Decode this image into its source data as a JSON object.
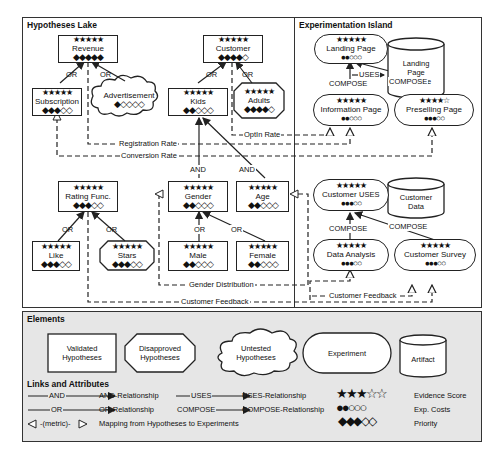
{
  "hypotheses_lake": {
    "title": "Hypotheses Lake",
    "nodes": {
      "revenue": {
        "label": "Revenue",
        "stars": "★★★★★",
        "priority": "◆◆◆◆◆",
        "type": "validated"
      },
      "subscription": {
        "label": "Subscription",
        "stars": "★★★★★",
        "priority": "◆◆◆◇◇",
        "type": "validated"
      },
      "advertisement": {
        "label": "Advertisement",
        "stars": "",
        "priority": "◆◇◇◇◇",
        "type": "untested"
      },
      "customer": {
        "label": "Customer",
        "stars": "★★★★★",
        "priority": "◆◆◆◆◇",
        "type": "validated"
      },
      "kids": {
        "label": "Kids",
        "stars": "★★★★★",
        "priority": "◆◆◇◇◇",
        "type": "validated"
      },
      "adults": {
        "label": "Adults",
        "stars": "★★★★★",
        "priority": "◆◆◆◆◇",
        "type": "disapproved"
      },
      "rating_func": {
        "label": "Rating Func.",
        "stars": "★★★★★",
        "priority": "◆◆◆◇◇",
        "type": "validated"
      },
      "like": {
        "label": "Like",
        "stars": "★★★★★",
        "priority": "◆◆◆◇◇",
        "type": "validated"
      },
      "stars_node": {
        "label": "Stars",
        "stars": "★★★★★",
        "priority": "◆◆◆◇◇",
        "type": "disapproved"
      },
      "gender": {
        "label": "Gender",
        "stars": "★★★★★",
        "priority": "◆◆◇◇◇",
        "type": "validated"
      },
      "age": {
        "label": "Age",
        "stars": "★★★★★",
        "priority": "◆◆◇◇◇",
        "type": "validated"
      },
      "male": {
        "label": "Male",
        "stars": "★★★★★",
        "priority": "◆◆◇◇◇",
        "type": "validated"
      },
      "female": {
        "label": "Female",
        "stars": "★★★★★",
        "priority": "◆◆◇◇◇",
        "type": "validated"
      }
    },
    "edge_labels": {
      "or": "OR",
      "and": "AND"
    }
  },
  "experimentation_island": {
    "title": "Experimentation Island",
    "nodes": {
      "landing_page": {
        "label": "Landing Page",
        "stars": "★★★★★",
        "costs": "●●○○○"
      },
      "information_page": {
        "label": "Information Page",
        "stars": "★★★★★",
        "costs": "●●○○○"
      },
      "preselling_page": {
        "label": "Preselling Page",
        "stars": "★★★★☆",
        "costs": "●●●○○"
      },
      "customer_analy": {
        "label": "Customer Analy.",
        "stars": "★★★★★",
        "costs": "●●●○○"
      },
      "data_analysis": {
        "label": "Data Analysis",
        "stars": "★★★★★",
        "costs": "●●●○○"
      },
      "customer_survey": {
        "label": "Customer Survey",
        "stars": "★★★★★",
        "costs": "●●●○○"
      }
    },
    "artifacts": {
      "landing_page_template": {
        "line1": "Landing",
        "line2": "Page",
        "line3": "Template"
      },
      "customer_data": {
        "line1": "Customer",
        "line2": "Data"
      }
    },
    "edge_labels": {
      "uses": "USES",
      "compose": "COMPOSE"
    }
  },
  "metrics": {
    "registration_rate": "Registration Rate",
    "conversion_rate": "Conversion Rate",
    "optin_rate": "OptIn Rate",
    "gender_distribution": "Gender Distribution",
    "customer_feedback": "Customer Feedback"
  },
  "legend": {
    "title": "Elements",
    "elements": {
      "validated": {
        "line1": "Validated",
        "line2": "Hypotheses"
      },
      "disapproved": {
        "line1": "Disapproved",
        "line2": "Hypotheses"
      },
      "untested": {
        "line1": "Untested",
        "line2": "Hypotheses"
      },
      "experiment": "Experiment",
      "artifact": "Artifact"
    },
    "links_title": "Links and Attributes",
    "links": {
      "and_tag": "AND",
      "and_desc": "AND-Relationship",
      "or_tag": "OR",
      "or_desc": "OR-Relationship",
      "uses_tag": "USES",
      "uses_desc": "USES-Relationship",
      "compose_tag": "COMPOSE",
      "compose_desc": "COMPOSE-Relationship",
      "metric_tag": "-(metric)-",
      "metric_desc": "Mapping from Hypotheses to Experiments"
    },
    "attributes": {
      "evidence_symbols": "★★★☆☆",
      "evidence_label": "Evidence Score",
      "costs_symbols": "●●○○○",
      "costs_label": "Exp. Costs",
      "priority_symbols": "◆◆◆◇◇",
      "priority_label": "Priority"
    }
  }
}
